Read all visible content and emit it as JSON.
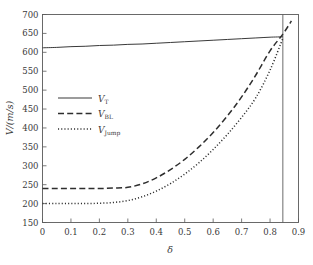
{
  "chart_data": {
    "type": "line",
    "title": "",
    "xlabel": "δ",
    "ylabel": "V/(m/s)",
    "xlim": [
      0,
      0.9
    ],
    "ylim": [
      150,
      700
    ],
    "xticks": [
      "0",
      "0.1",
      "0.2",
      "0.3",
      "0.4",
      "0.5",
      "0.6",
      "0.7",
      "0.8",
      "0.9"
    ],
    "xtick_values": [
      0,
      0.1,
      0.2,
      0.3,
      0.4,
      0.5,
      0.6,
      0.7,
      0.8,
      0.9
    ],
    "yticks": [
      "150",
      "200",
      "250",
      "300",
      "350",
      "400",
      "450",
      "500",
      "550",
      "600",
      "650",
      "700"
    ],
    "ytick_values": [
      150,
      200,
      250,
      300,
      350,
      400,
      450,
      500,
      550,
      600,
      650,
      700
    ],
    "grid": false,
    "legend_position": "center-left",
    "series": [
      {
        "name": "V_T",
        "label": "V",
        "sublabel": "T",
        "style": "solid",
        "color": "#2e2e2e",
        "x": [
          0.0,
          0.05,
          0.1,
          0.15,
          0.2,
          0.25,
          0.3,
          0.35,
          0.4,
          0.45,
          0.5,
          0.55,
          0.6,
          0.65,
          0.7,
          0.75,
          0.8,
          0.845
        ],
        "values": [
          612,
          613,
          615,
          616,
          618,
          619,
          621,
          622,
          624,
          626,
          628,
          630,
          632,
          634,
          636,
          638,
          640,
          641
        ]
      },
      {
        "name": "V_BL",
        "label": "V",
        "sublabel": "BL",
        "style": "dashed",
        "color": "#2e2e2e",
        "x": [
          0.0,
          0.05,
          0.1,
          0.15,
          0.2,
          0.25,
          0.3,
          0.35,
          0.4,
          0.45,
          0.5,
          0.55,
          0.6,
          0.65,
          0.7,
          0.75,
          0.8,
          0.845,
          0.875
        ],
        "values": [
          240,
          240,
          240,
          240,
          240,
          241,
          243,
          252,
          268,
          290,
          317,
          350,
          388,
          432,
          482,
          540,
          604,
          648,
          683
        ]
      },
      {
        "name": "V_Jump",
        "label": "V",
        "sublabel": "Jump",
        "style": "dotted",
        "color": "#2e2e2e",
        "x": [
          0.0,
          0.05,
          0.1,
          0.15,
          0.2,
          0.25,
          0.3,
          0.35,
          0.4,
          0.45,
          0.5,
          0.55,
          0.6,
          0.65,
          0.7,
          0.75,
          0.8,
          0.845
        ],
        "values": [
          200,
          200,
          200,
          200,
          201,
          203,
          208,
          218,
          233,
          253,
          278,
          308,
          343,
          383,
          428,
          480,
          553,
          637
        ]
      }
    ],
    "annotations": [
      {
        "name": "critical-delta-line",
        "type": "vertical-line",
        "x": 0.845,
        "style": "solid",
        "color": "#5a5a5a"
      }
    ]
  }
}
